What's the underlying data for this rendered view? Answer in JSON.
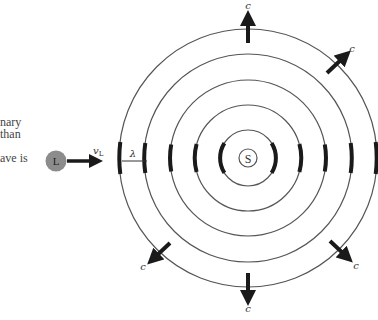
{
  "left_text": {
    "line1": "nary",
    "line2": "than",
    "line3": "ave is"
  },
  "diagram": {
    "source_label": "S",
    "listener_label": "L",
    "listener_velocity_label": "vL",
    "listener_velocity_symbol": "v",
    "listener_velocity_subscript": "L",
    "wavelength_label": "λ",
    "wave_speed_label": "c",
    "colors": {
      "ring": "#555555",
      "crest": "#1a1a1a",
      "listener_fill": "#8c8c8c",
      "arrow": "#1a1a1a"
    },
    "center": [
      248,
      158
    ],
    "ring_radii": [
      28,
      53,
      78,
      104,
      129
    ],
    "source_radius": 9
  }
}
